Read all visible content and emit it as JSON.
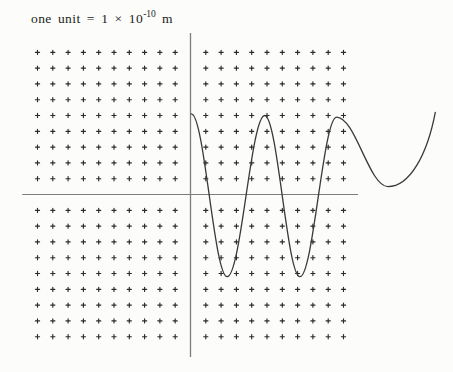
{
  "caption": {
    "prefix": "one unit = 1 × 10",
    "exponent": "-10",
    "suffix": " m"
  },
  "colors": {
    "background": "#fcfcfa",
    "dot_ink": "#2b2b2b",
    "axis": "#7d7d7d",
    "curve": "#3a3a3a"
  },
  "chart_data": {
    "type": "line",
    "xlabel": "",
    "ylabel": "",
    "legend": "none",
    "grid": {
      "style": "plus-mark lattice at integer unit positions",
      "x_min": -10,
      "x_max": 10,
      "y_min": -9,
      "y_max": 9,
      "omit_zero_row_col": true
    },
    "x_axis_units": [
      -11.0,
      10.95
    ],
    "y_axis_units": [
      -10.28,
      10.22
    ],
    "series": [
      {
        "name": "wave-curve",
        "shape": "smooth wave: alternating crests/troughs then wide shallow dip rising at right edge",
        "keypoints_units": [
          [
            0.05,
            5.1
          ],
          [
            2.4,
            -5.2
          ],
          [
            4.85,
            5.0
          ],
          [
            7.15,
            -5.2
          ],
          [
            9.55,
            4.9
          ],
          [
            12.9,
            0.5
          ],
          [
            16.0,
            5.2
          ]
        ]
      }
    ],
    "layout": {
      "origin_px": [
        190.5,
        194.5
      ],
      "unit_px": [
        15.3,
        15.8
      ],
      "legend_position": "none",
      "gridlines": false
    }
  }
}
